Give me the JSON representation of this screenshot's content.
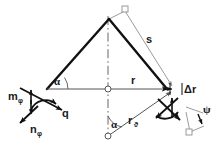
{
  "figure": {
    "type": "technical-line-diagram",
    "width": 223,
    "height": 150,
    "background": "#ffffff"
  },
  "colors": {
    "heavy_line": "#111111",
    "light_line": "#8f8f8f",
    "medium_line": "#555555",
    "text": "#1a1a1a",
    "marker_fill": "#ffffff"
  },
  "labels": {
    "s": "s",
    "r": "r",
    "delta_r": "Δr",
    "alpha_top": "α",
    "alpha_bottom": "α",
    "psi": "ψ",
    "q": "q",
    "m_phi_base": "m",
    "m_phi_sub": "φ",
    "n_phi_base": "n",
    "n_phi_sub": "φ",
    "r_theta_base": "r",
    "r_theta_sub": "ϑ"
  },
  "elements": {
    "apex_marker": "square-marker",
    "center_marker": "circle-marker",
    "origin_marker": "circle-marker",
    "top_right_marker": "square-marker",
    "bottom_right_marker": "square-marker",
    "axis": "dash-dot-vertical-axis",
    "left_vector_cluster": "moment-force-arrows",
    "right_vector_cluster": "moment-force-arrows"
  },
  "geometry": {
    "apex": [
      109,
      19
    ],
    "left_vertex": [
      47,
      89
    ],
    "right_vertex": [
      167,
      89
    ],
    "origin": [
      108,
      136
    ],
    "center": [
      108,
      89
    ],
    "top_square": [
      125,
      8
    ],
    "right_square": [
      188,
      138
    ]
  }
}
